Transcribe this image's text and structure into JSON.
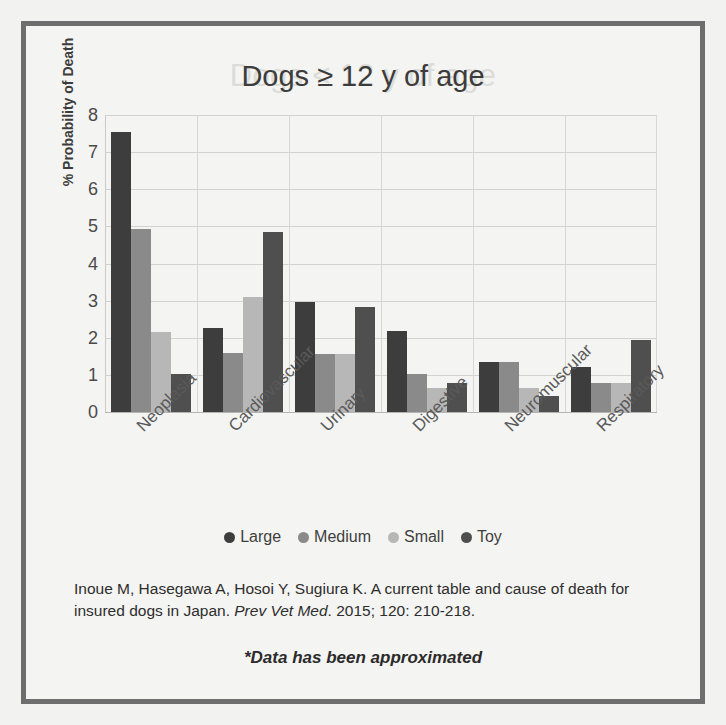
{
  "slide": {
    "background_color": "#f4f4f2",
    "border_color": "#6e6e6e",
    "ghost_title": "Dogs < 12 y of age"
  },
  "chart_data": {
    "type": "bar",
    "title": "Dogs ≥  12 y of age",
    "xlabel": "",
    "ylabel": "% Probability of Death",
    "ylim": [
      0,
      8
    ],
    "yticks": [
      0,
      1,
      2,
      3,
      4,
      5,
      6,
      7,
      8
    ],
    "grid": true,
    "legend_position": "bottom",
    "categories": [
      "Neoplasia",
      "Cardiovascular",
      "Urinary",
      "Digestive",
      "Neuromuscular",
      "Respiratory"
    ],
    "series": [
      {
        "name": "Large",
        "color": "#3d3d3d",
        "values": [
          7.55,
          2.25,
          2.95,
          2.18,
          1.35,
          1.22
        ]
      },
      {
        "name": "Medium",
        "color": "#8a8a8a",
        "values": [
          4.92,
          1.6,
          1.55,
          1.02,
          1.35,
          0.78
        ]
      },
      {
        "name": "Small",
        "color": "#b7b7b7",
        "values": [
          2.15,
          3.1,
          1.55,
          0.65,
          0.65,
          0.78
        ]
      },
      {
        "name": "Toy",
        "color": "#4f4f4f",
        "values": [
          1.02,
          4.85,
          2.82,
          0.78,
          0.42,
          1.95
        ]
      }
    ]
  },
  "citation": {
    "part1": "Inoue M, Hasegawa A, Hosoi Y, Sugiura K. A current table and cause of death for insured dogs in Japan. ",
    "journal": "Prev Vet Med",
    "part2": ". 2015; 120: 210-218."
  },
  "footnote": "*Data has been  approximated"
}
